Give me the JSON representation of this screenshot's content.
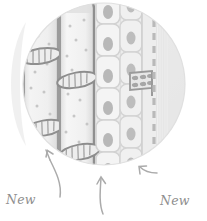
{
  "figure": {
    "kind": "botanical-diagram",
    "frame_shape": "circle"
  },
  "labels": {
    "xylem": {
      "line1": "New",
      "line2": "xylem"
    },
    "phloem": {
      "line1": "New",
      "line2": "phloem"
    },
    "cambium": {
      "line1": "Cambium"
    }
  },
  "colors": {
    "background": "#ffffff",
    "circle_fill": "#ececec",
    "circle_fill_light": "#f4f4f4",
    "highlight_crescent": "#ffffff",
    "cell_fill": "#f2f2f2",
    "cell_fill_alt": "#e7e7e7",
    "vessel_outline": "#9a9a9a",
    "vessel_outline_dark": "#8a8a8a",
    "nucleus": "#b5b5b5",
    "pit_dot": "#c2c2c2",
    "hatch": "#a0a0a0",
    "dashed_line": "#b9b9b9",
    "label_text": "#8e8e8e",
    "leader_line": "#a8a8a8"
  },
  "structures": {
    "xylem_vessels": {
      "name": "xylem vessels",
      "count": 2,
      "features": [
        "pitted walls",
        "perforation plates",
        "rounded vessel caps"
      ]
    },
    "cambium_cells": {
      "name": "vascular cambium cells",
      "columns": 2,
      "features": [
        "rectangular cells",
        "oval nuclei"
      ]
    },
    "phloem": {
      "name": "phloem with sieve plate",
      "features": [
        "sieve plate",
        "dashed boundary line",
        "striated wall"
      ]
    }
  },
  "annotations": [
    {
      "target": "xylem",
      "leader": "curved-arrow-up-right",
      "arrow_head": "up"
    },
    {
      "target": "cambium",
      "leader": "curved-arrow-up",
      "arrow_head": "up"
    },
    {
      "target": "phloem",
      "leader": "arrow-up-left",
      "arrow_head": "up-left"
    }
  ]
}
